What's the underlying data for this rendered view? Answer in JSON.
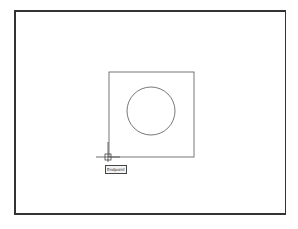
{
  "canvas": {
    "background": "#ffffff",
    "frame_color": "#333333",
    "square": {
      "x": 109,
      "y": 72,
      "size": 85
    },
    "circle": {
      "cx": 151,
      "cy": 111,
      "r": 24
    },
    "cursor": {
      "x": 108,
      "y": 157
    }
  },
  "osnap": {
    "tooltip": "Endpoint"
  }
}
